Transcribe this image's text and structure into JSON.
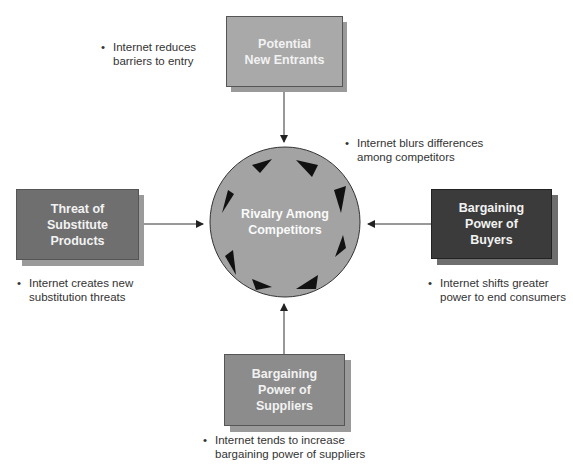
{
  "diagram": {
    "center": {
      "label_line1": "Rivalry Among",
      "label_line2": "Competitors"
    },
    "forces": {
      "top": {
        "lines": [
          "Potential",
          "New Entrants"
        ],
        "color": "#a9a9a9",
        "note": [
          "Internet reduces",
          "barriers to entry"
        ]
      },
      "left": {
        "lines": [
          "Threat of",
          "Substitute",
          "Products"
        ],
        "color": "#6f6f6f",
        "note": [
          "Internet creates new",
          "substitution threats"
        ]
      },
      "right": {
        "lines": [
          "Bargaining",
          "Power of",
          "Buyers"
        ],
        "color": "#3b3b3b",
        "note": [
          "Internet shifts greater",
          "power to end consumers"
        ]
      },
      "bottom": {
        "lines": [
          "Bargaining",
          "Power of",
          "Suppliers"
        ],
        "color": "#8c8c8c",
        "note": [
          "Internet tends to increase",
          "bargaining power of suppliers"
        ]
      }
    },
    "center_note": [
      "Internet blurs differences",
      "among competitors"
    ],
    "bullet": "•",
    "colors": {
      "circle": "#a3a3a3",
      "arrow": "#222222",
      "text_on_box": "#f2f2f2"
    }
  }
}
